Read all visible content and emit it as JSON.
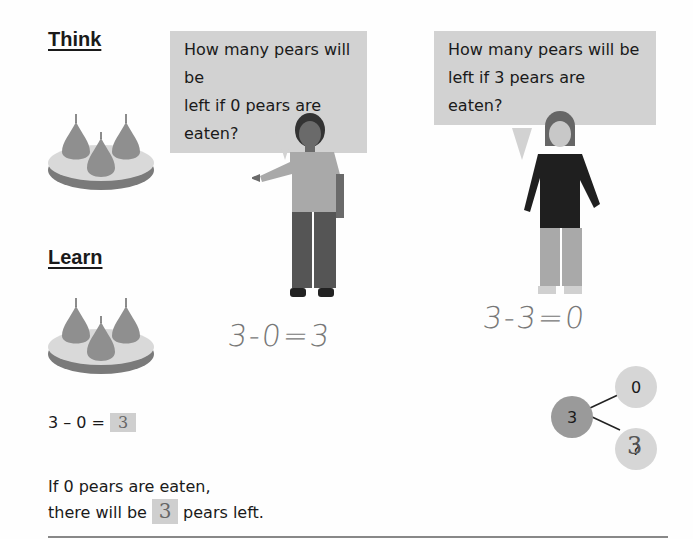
{
  "think": {
    "heading": "Think",
    "bubble_left": [
      "How many pears will be",
      "left if 0 pears are eaten?"
    ],
    "bubble_right": [
      "How many pears will be",
      "left if 3 pears are eaten?"
    ],
    "handwritten_left": "3-0=3",
    "handwritten_right": "3-3=0"
  },
  "learn": {
    "heading": "Learn",
    "equation_prefix": "3 – 0 =",
    "equation_answer": "3",
    "sentence_line1": "If 0 pears are eaten,",
    "sentence_line2_prefix": "there will be",
    "sentence_answer": "3",
    "sentence_line2_suffix": "pears left."
  },
  "number_bond": {
    "whole": "3",
    "part_top": "0",
    "part_bottom": "?",
    "part_bottom_handwritten": "3"
  },
  "colors": {
    "bubble": "#d2d2d2",
    "pear": "#8f8f8f",
    "plate_top": "#d9d9d9",
    "plate_side": "#7a7a7a",
    "node_whole": "#9a9a9a",
    "node_part": "#d6d6d6"
  }
}
